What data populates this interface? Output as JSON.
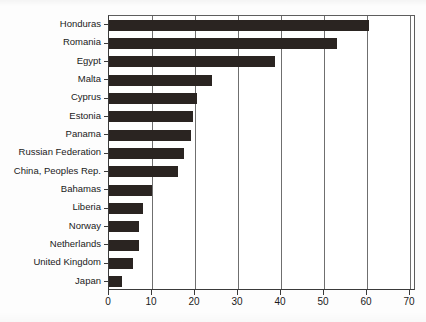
{
  "chart_data": {
    "type": "bar",
    "orientation": "horizontal",
    "title": "",
    "subtitle": "",
    "xlabel": "",
    "ylabel": "",
    "xlim": [
      0,
      70
    ],
    "xticks": [
      0,
      10,
      20,
      30,
      40,
      50,
      60,
      70
    ],
    "xtick_labels": [
      "0",
      "10",
      "20",
      "30",
      "40",
      "50",
      "60",
      "70"
    ],
    "grid": true,
    "grid_axis": "x",
    "legend": false,
    "legend_position": "none",
    "bar_color": "#2a2421",
    "grid_color": "#6f6f6f",
    "frame_color": "#3a3a3a",
    "background": "#ffffff",
    "categories": [
      "Honduras",
      "Romania",
      "Egypt",
      "Malta",
      "Cyprus",
      "Estonia",
      "Panama",
      "Russian Federation",
      "China, Peoples Rep.",
      "Bahamas",
      "Liberia",
      "Norway",
      "Netherlands",
      "United Kingdom",
      "Japan"
    ],
    "values": [
      60.5,
      53,
      38.5,
      24,
      20.5,
      19.5,
      19,
      17.5,
      16,
      10,
      8,
      7,
      7,
      5.5,
      3
    ]
  }
}
